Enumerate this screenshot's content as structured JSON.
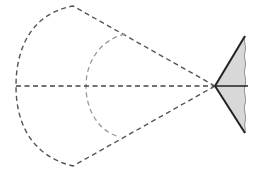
{
  "diagram": {
    "type": "geometric-cone-sector",
    "colors": {
      "outer_dash": "#555555",
      "inner_dash": "#999999",
      "axis_dash": "#444444",
      "fill": "#d8d8d8",
      "solid": "#222222",
      "background": "#ffffff"
    },
    "apex": [
      215,
      86
    ],
    "outer_sector": {
      "top": [
        73,
        6
      ],
      "left": [
        16,
        86
      ],
      "bottom": [
        73,
        166
      ]
    },
    "inner_arc": {
      "top": [
        125,
        34
      ],
      "left": [
        86,
        86
      ],
      "bottom": [
        120,
        137
      ]
    },
    "triangle": {
      "top": [
        245,
        36
      ],
      "bottom": [
        245,
        133
      ]
    },
    "axis": {
      "from": [
        16,
        86
      ],
      "to": [
        248,
        86
      ]
    }
  }
}
